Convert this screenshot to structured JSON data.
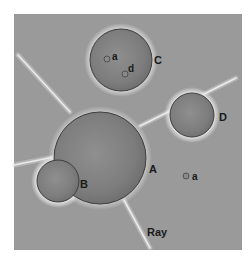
{
  "figure": {
    "background_color": "#9a9a9a",
    "frame": {
      "x": 14,
      "y": 14,
      "width": 228,
      "height": 236
    },
    "objects": [
      {
        "id": "A",
        "label": "A",
        "cx": 100,
        "cy": 158,
        "r": 46,
        "label_x": 149,
        "label_y": 173
      },
      {
        "id": "B",
        "label": "B",
        "cx": 58,
        "cy": 181,
        "r": 21,
        "label_x": 80,
        "label_y": 188
      },
      {
        "id": "C",
        "label": "C",
        "cx": 121,
        "cy": 60,
        "r": 31,
        "label_x": 154,
        "label_y": 64
      },
      {
        "id": "D",
        "label": "D",
        "cx": 192,
        "cy": 115,
        "r": 22,
        "label_x": 219,
        "label_y": 121
      }
    ],
    "small_features": [
      {
        "id": "a-in-C",
        "label": "a",
        "cx": 107,
        "cy": 59,
        "r": 3,
        "label_x": 112,
        "label_y": 60
      },
      {
        "id": "d-in-C",
        "label": "d",
        "cx": 125,
        "cy": 74,
        "r": 3,
        "label_x": 128,
        "label_y": 72
      },
      {
        "id": "a-outside",
        "label": "a",
        "cx": 186,
        "cy": 176,
        "r": 3,
        "label_x": 192,
        "label_y": 180
      }
    ],
    "rays": [
      {
        "x1": 18,
        "y1": 55,
        "x2": 70,
        "y2": 112
      },
      {
        "x1": 140,
        "y1": 126,
        "x2": 236,
        "y2": 78
      },
      {
        "x1": 124,
        "y1": 200,
        "x2": 150,
        "y2": 248
      },
      {
        "x1": 14,
        "y1": 165,
        "x2": 54,
        "y2": 157
      }
    ],
    "ray_label": {
      "text": "Ray",
      "x": 147,
      "y": 236
    }
  }
}
